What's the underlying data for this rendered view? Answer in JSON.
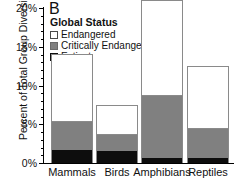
{
  "panel_letter": "B",
  "legend": {
    "title": "Global Status",
    "entries": [
      {
        "label": "Endangered",
        "color": "#ffffff",
        "swatch": "endangered-swatch"
      },
      {
        "label": "Critically Endangered",
        "color": "#808080",
        "swatch": "critically-endangered-swatch"
      },
      {
        "label": "Extinct",
        "color": "#0d0d0d",
        "swatch": "extinct-swatch"
      }
    ]
  },
  "axes": {
    "ylabel": "Percent of Total Group Diversity",
    "ytick_labels": [
      "0%",
      "5%",
      "10%",
      "15%",
      "20%"
    ],
    "xtick_labels": [
      "Mammals",
      "Birds",
      "Amphibians",
      "Reptiles"
    ]
  },
  "chart_data": {
    "type": "bar",
    "subtype": "stacked",
    "title": "B",
    "xlabel": "",
    "ylabel": "Percent of Total Group Diversity",
    "ylim": [
      0,
      20
    ],
    "yticks": [
      0,
      5,
      10,
      15,
      20
    ],
    "ytick_labels": [
      "0%",
      "5%",
      "10%",
      "15%",
      "20%"
    ],
    "grid": false,
    "legend_position": "upper-left-inside",
    "legend_title": "Global Status",
    "categories": [
      "Mammals",
      "Birds",
      "Amphibians",
      "Reptiles"
    ],
    "series": [
      {
        "name": "Extinct",
        "color": "#0d0d0d",
        "values": [
          1.7,
          1.6,
          0.6,
          0.6
        ]
      },
      {
        "name": "Critically Endangered",
        "color": "#808080",
        "values": [
          3.6,
          2.0,
          8.1,
          3.8
        ]
      },
      {
        "name": "Endangered",
        "color": "#ffffff",
        "values": [
          8.8,
          3.9,
          12.3,
          8.1
        ]
      }
    ],
    "cumulative_tops": {
      "Extinct": [
        1.7,
        1.6,
        0.6,
        0.6
      ],
      "Critically Endangered": [
        5.3,
        3.6,
        8.7,
        4.4
      ],
      "Endangered": [
        14.1,
        7.5,
        21.0,
        12.5
      ]
    },
    "totals": [
      14.1,
      7.5,
      21.0,
      12.5
    ]
  }
}
